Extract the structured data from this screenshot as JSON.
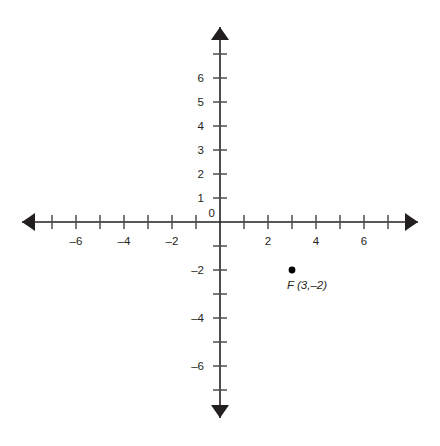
{
  "chart_data": {
    "type": "scatter",
    "title": "",
    "xlabel": "",
    "ylabel": "",
    "xlim": [
      -7.5,
      8.2
    ],
    "ylim": [
      -8.2,
      8.1
    ],
    "grid": false,
    "legend": "none",
    "axes": {
      "x_ticks": [
        -7,
        -6,
        -5,
        -4,
        -3,
        -2,
        -1,
        1,
        2,
        3,
        4,
        5,
        6,
        7
      ],
      "y_ticks": [
        -7,
        -6,
        -5,
        -4,
        -3,
        -2,
        -1,
        1,
        2,
        3,
        4,
        5,
        6,
        7
      ],
      "x_tick_labels": [
        {
          "value": -6,
          "text": "–6"
        },
        {
          "value": -4,
          "text": "–4"
        },
        {
          "value": -2,
          "text": "–2"
        },
        {
          "value": 2,
          "text": "2"
        },
        {
          "value": 4,
          "text": "4"
        },
        {
          "value": 6,
          "text": "6"
        }
      ],
      "y_tick_labels": [
        {
          "value": 6,
          "text": "6"
        },
        {
          "value": 5,
          "text": "5"
        },
        {
          "value": 4,
          "text": "4"
        },
        {
          "value": 3,
          "text": "3"
        },
        {
          "value": 2,
          "text": "2"
        },
        {
          "value": 1,
          "text": "1"
        },
        {
          "value": -2,
          "text": "–2"
        },
        {
          "value": -4,
          "text": "–4"
        },
        {
          "value": -6,
          "text": "–6"
        }
      ],
      "origin_label": "0",
      "x_arrows": "both",
      "y_arrows": "both"
    },
    "points": [
      {
        "name": "F",
        "x": 3,
        "y": -2,
        "label": "F (3,–2)",
        "color": "#000000"
      }
    ]
  },
  "colors": {
    "background": "#ffffff",
    "axis": "#231f20",
    "tick": "#4d4d4d",
    "text": "#231f20",
    "point": "#000000"
  }
}
